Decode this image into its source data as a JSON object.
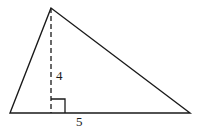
{
  "diagram": {
    "type": "triangle",
    "labels": {
      "height": "4",
      "base": "5"
    },
    "elements": [
      "triangle",
      "dashed-altitude",
      "right-angle-marker"
    ]
  }
}
